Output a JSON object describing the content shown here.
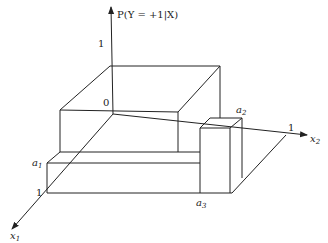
{
  "diagram": {
    "type": "3d-probability-surface",
    "axes": {
      "vertical": {
        "label": "P(Y = +1|X)",
        "tick": "1"
      },
      "x1": {
        "label": "x",
        "subscript": "1",
        "tick": "1"
      },
      "x2": {
        "label": "x",
        "subscript": "2",
        "tick": "1"
      },
      "origin": "0"
    },
    "annotations": {
      "a1": {
        "label": "a",
        "subscript": "1"
      },
      "a2": {
        "label": "a",
        "subscript": "2"
      },
      "a3": {
        "label": "a",
        "subscript": "3"
      }
    },
    "stroke_color": "#222222"
  }
}
